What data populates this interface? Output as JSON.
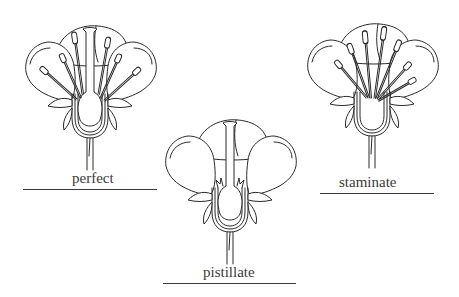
{
  "diagram": {
    "type": "botanical-illustration",
    "flowers": [
      {
        "id": "perfect",
        "label": "perfect",
        "has_pistil": true,
        "has_stamens": true
      },
      {
        "id": "pistillate",
        "label": "pistillate",
        "has_pistil": true,
        "has_stamens": false
      },
      {
        "id": "staminate",
        "label": "staminate",
        "has_pistil": false,
        "has_stamens": true
      }
    ],
    "colors": {
      "ink": "#2a2a2a",
      "background": "#ffffff",
      "label": "#3a3a3a"
    }
  }
}
